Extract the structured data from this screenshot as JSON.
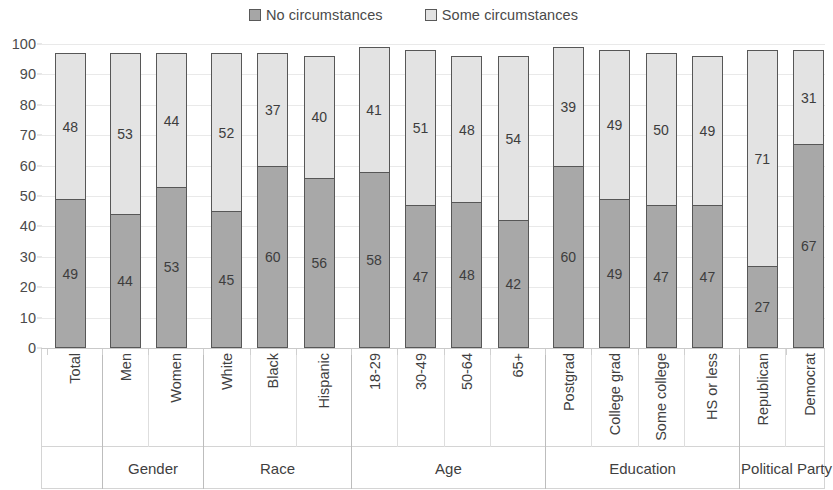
{
  "legend": {
    "entries": [
      {
        "label": "No circumstances",
        "color": "#a8a8a8"
      },
      {
        "label": "Some circumstances",
        "color": "#e3e3e3"
      }
    ]
  },
  "axis": {
    "y_ticks": [
      "0",
      "10",
      "20",
      "30",
      "40",
      "50",
      "60",
      "70",
      "80",
      "90",
      "100"
    ]
  },
  "groups": [
    {
      "label": "",
      "categories": [
        "Total"
      ]
    },
    {
      "label": "Gender",
      "categories": [
        "Men",
        "Women"
      ]
    },
    {
      "label": "Race",
      "categories": [
        "White",
        "Black",
        "Hispanic"
      ]
    },
    {
      "label": "Age",
      "categories": [
        "18-29",
        "30-49",
        "50-64",
        "65+"
      ]
    },
    {
      "label": "Education",
      "categories": [
        "Postgrad",
        "College grad",
        "Some college",
        "HS or less"
      ]
    },
    {
      "label": "Political Party",
      "categories": [
        "Republican",
        "Democrat"
      ]
    }
  ],
  "chart_data": {
    "type": "bar",
    "subtype": "stacked-vertical",
    "title": "",
    "xlabel": "",
    "ylabel": "",
    "ylim": [
      0,
      100
    ],
    "y_ticks": [
      0,
      10,
      20,
      30,
      40,
      50,
      60,
      70,
      80,
      90,
      100
    ],
    "grid": true,
    "legend_position": "top-center",
    "categories": [
      "Total",
      "Men",
      "Women",
      "White",
      "Black",
      "Hispanic",
      "18-29",
      "30-49",
      "50-64",
      "65+",
      "Postgrad",
      "College grad",
      "Some college",
      "HS or less",
      "Republican",
      "Democrat"
    ],
    "category_groups": [
      "",
      "Gender",
      "Gender",
      "Race",
      "Race",
      "Race",
      "Age",
      "Age",
      "Age",
      "Age",
      "Education",
      "Education",
      "Education",
      "Education",
      "Political Party",
      "Political Party"
    ],
    "series": [
      {
        "name": "No circumstances",
        "color": "#a8a8a8",
        "values": [
          49,
          44,
          53,
          45,
          60,
          56,
          58,
          47,
          48,
          42,
          60,
          49,
          47,
          47,
          27,
          67
        ]
      },
      {
        "name": "Some circumstances",
        "color": "#e3e3e3",
        "values": [
          48,
          53,
          44,
          52,
          37,
          40,
          41,
          51,
          48,
          54,
          39,
          49,
          50,
          49,
          71,
          31
        ]
      }
    ],
    "totals": [
      97,
      97,
      97,
      97,
      97,
      96,
      99,
      98,
      96,
      96,
      99,
      98,
      97,
      96,
      98,
      98
    ]
  }
}
